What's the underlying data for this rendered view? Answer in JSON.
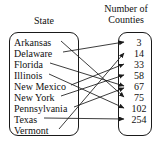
{
  "figure": {
    "type": "mapping-diagram",
    "left_set": {
      "title": "State",
      "items": [
        {
          "label": "Arkansas"
        },
        {
          "label": "Delaware"
        },
        {
          "label": "Florida"
        },
        {
          "label": "Illinois"
        },
        {
          "label": "New Mexico"
        },
        {
          "label": "New York"
        },
        {
          "label": "Pennsylvania"
        },
        {
          "label": "Texas"
        },
        {
          "label": "Vermont"
        }
      ]
    },
    "right_set": {
      "title": "Number of Counties",
      "title_line1": "Number of",
      "title_line2": "Counties",
      "items": [
        {
          "label": "3"
        },
        {
          "label": "14"
        },
        {
          "label": "33"
        },
        {
          "label": "58"
        },
        {
          "label": "67"
        },
        {
          "label": "75"
        },
        {
          "label": "102"
        },
        {
          "label": "254"
        }
      ]
    },
    "mappings": [
      {
        "from": "Arkansas",
        "to": "75"
      },
      {
        "from": "Delaware",
        "to": "3"
      },
      {
        "from": "Florida",
        "to": "67"
      },
      {
        "from": "Illinois",
        "to": "102"
      },
      {
        "from": "New Mexico",
        "to": "33"
      },
      {
        "from": "New York",
        "to": "58"
      },
      {
        "from": "Pennsylvania",
        "to": "67"
      },
      {
        "from": "Texas",
        "to": "254"
      },
      {
        "from": "Vermont",
        "to": "14"
      }
    ],
    "colors": {
      "ink": "#111111",
      "outline": "#1a1a1a",
      "background": "#ffffff"
    }
  }
}
